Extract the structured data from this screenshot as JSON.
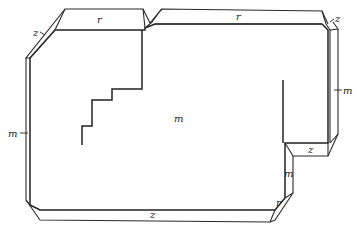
{
  "figure": {
    "type": "crystal-habit-drawing",
    "labels": {
      "top_left_r": "r",
      "top_right_r": "r",
      "top_left_z": "z",
      "top_right_z": "z",
      "left_m": "m",
      "right_m": "m",
      "center_m": "m",
      "notch_z": "z",
      "notch_m": "m",
      "bottom_r": "r",
      "bottom_z": "z"
    },
    "colors": {
      "line": "#2a2a2a",
      "background": "#ffffff"
    }
  }
}
